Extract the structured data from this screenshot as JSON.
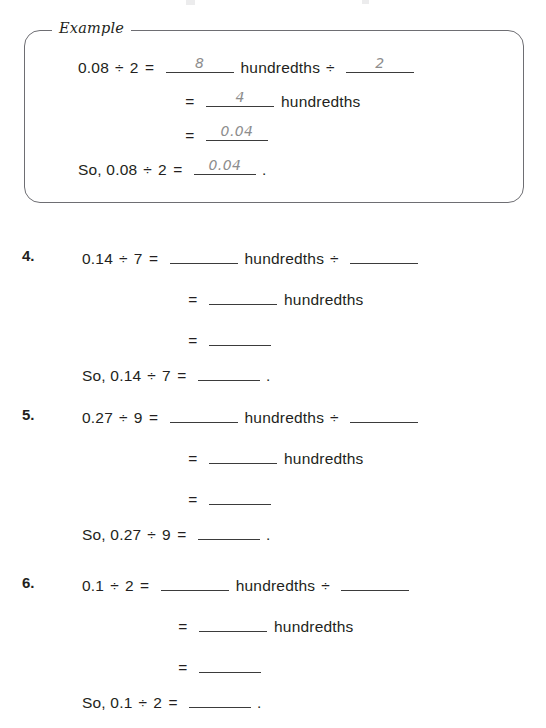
{
  "worksheet": {
    "example": {
      "label": "Example",
      "lines": [
        {
          "lhs": "0.08",
          "divide_symbol": "÷",
          "rhs": "2",
          "equals": "=",
          "blank1_value": "8",
          "unit": "hundredths",
          "divide_symbol2": "÷",
          "blank2_value": "2"
        },
        {
          "equals": "=",
          "blank1_value": "4",
          "unit": "hundredths"
        },
        {
          "equals": "=",
          "blank1_value": "0.04"
        },
        {
          "prefix": "So, 0.08",
          "divide_symbol": "÷",
          "rhs": "2",
          "equals": "=",
          "blank1_value": "0.04",
          "period": "."
        }
      ]
    },
    "problems": [
      {
        "number": "4.",
        "dividend": "0.14",
        "divisor": "7",
        "divide_symbol": "÷",
        "equals": "=",
        "unit": "hundredths",
        "so_prefix": "So, 0.14",
        "period": "."
      },
      {
        "number": "5.",
        "dividend": "0.27",
        "divisor": "9",
        "divide_symbol": "÷",
        "equals": "=",
        "unit": "hundredths",
        "so_prefix": "So, 0.27",
        "period": "."
      },
      {
        "number": "6.",
        "dividend": "0.1",
        "divisor": "2",
        "divide_symbol": "÷",
        "equals": "=",
        "unit": "hundredths",
        "so_prefix": "So, 0.1",
        "period": "."
      }
    ]
  },
  "colors": {
    "ink": "#231f20",
    "handwriting": "#8d8d8d",
    "rule": "#3b3b3b",
    "box_border": "#6e6e73"
  }
}
